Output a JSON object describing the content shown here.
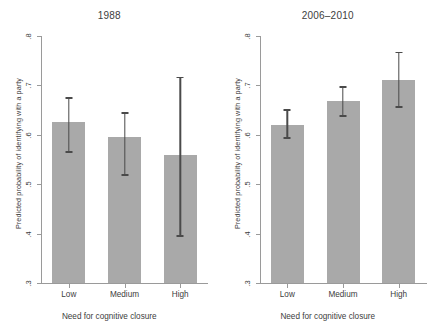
{
  "figure": {
    "background": "#ffffff",
    "bar_color": "#a9a9a9",
    "error_color": "#4a4a4a",
    "axis_color": "#9a9a9a"
  },
  "chart_data": {
    "type": "bar",
    "title": "",
    "xlabel": "Need for cognitive closure",
    "ylabel": "Predicted probability of identifying with a party",
    "categories": [
      "Low",
      "Medium",
      "High"
    ],
    "ylim": [
      0.3,
      0.8
    ],
    "yticks": [
      0.3,
      0.4,
      0.5,
      0.6,
      0.7,
      0.8
    ],
    "ytick_labels": [
      ".3",
      ".4",
      ".5",
      ".6",
      ".7",
      ".8"
    ],
    "grid": false,
    "legend": "none",
    "panels": [
      {
        "title": "1988",
        "xlabel": "Need for cognitive closure",
        "ylabel": "Predicted probability of identifying with a party",
        "categories": [
          "Low",
          "Medium",
          "High"
        ],
        "values": [
          0.626,
          0.595,
          0.559
        ],
        "ci_low": [
          0.564,
          0.517,
          0.393
        ],
        "ci_high": [
          0.676,
          0.646,
          0.718
        ]
      },
      {
        "title": "2006–2010",
        "xlabel": "Need for cognitive closure",
        "ylabel": "Predicted probability of identifying with a party",
        "categories": [
          "Low",
          "Medium",
          "High"
        ],
        "values": [
          0.62,
          0.668,
          0.711
        ],
        "ci_low": [
          0.592,
          0.637,
          0.655
        ],
        "ci_high": [
          0.652,
          0.698,
          0.768
        ]
      }
    ]
  }
}
